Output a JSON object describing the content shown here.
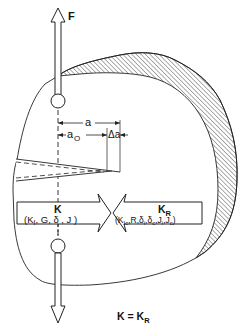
{
  "diagram": {
    "type": "fracture-mechanics-schematic",
    "force_label": "F",
    "dimensions": {
      "crack_length": "a",
      "initial_crack_length": "a",
      "initial_crack_subscript": "O",
      "crack_extension": "Δa"
    },
    "driving_force": {
      "title": "K",
      "params_open": "(",
      "params": "K",
      "params_sub": "I",
      "params_rest": ", G, δ , J )"
    },
    "resistance": {
      "title": "K",
      "title_sub": "R",
      "p0": "(K",
      "p0_sub": "Ic",
      "p1": ",R,δ",
      "p1_sub": "i",
      "p2": ",δ",
      "p2_sub": "c",
      "p3": ",J",
      "p3_sub": "i",
      "p4": ",J",
      "p4_sub": "c",
      "p5": ")"
    },
    "equation": {
      "lhs": "K = K",
      "rhs_sub": "R"
    },
    "colors": {
      "line": "#222222",
      "background": "#ffffff"
    }
  }
}
